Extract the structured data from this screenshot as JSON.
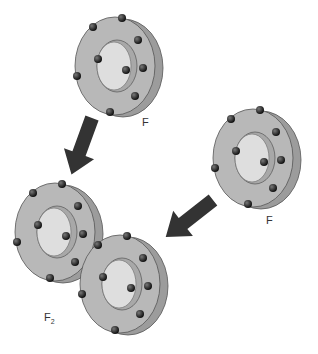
{
  "labels": {
    "atom_top": "F",
    "atom_right": "F",
    "molecule_main": "F",
    "molecule_sub": "2"
  },
  "colors": {
    "disk_face": "#b4b4b4",
    "disk_side": "#9a9a9a",
    "hole": "#dcdcdc",
    "electron": "#2a2a2a",
    "arrow": "#333333"
  },
  "atoms": [
    {
      "name": "top",
      "electrons_outer": 7,
      "electrons_inner": 2
    },
    {
      "name": "right",
      "electrons_outer": 7,
      "electrons_inner": 2
    },
    {
      "name": "molecule-left",
      "electrons_outer": 7,
      "electrons_inner": 2
    },
    {
      "name": "molecule-right",
      "electrons_outer": 7,
      "electrons_inner": 2
    }
  ]
}
